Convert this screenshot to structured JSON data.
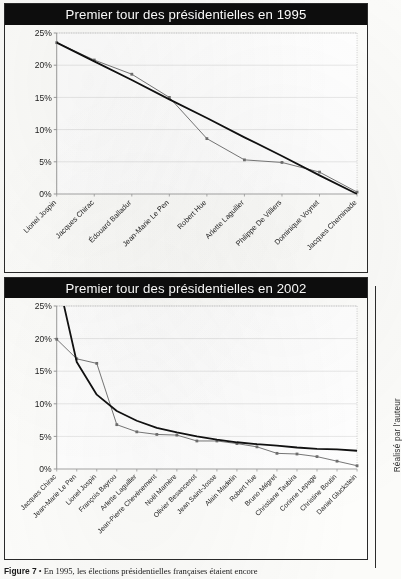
{
  "figure": {
    "caption_label": "Figure 7",
    "caption_sep": "•",
    "caption_text": "En 1995, les élections présidentielles françaises étaient encore",
    "credit": "Réalisé par l'auteur"
  },
  "colors": {
    "title_bar_bg": "#0d0d0d",
    "title_bar_text": "#ffffff",
    "data_series": "#6f6f6f",
    "trend_series": "#111111",
    "axis": "#8a8a8a",
    "gridline": "#d9d9d9",
    "plot_border": "#b8b8b8"
  },
  "charts": [
    {
      "id": "presidentielles-1995",
      "title": "Premier tour des présidentielles en 1995"
    },
    {
      "id": "presidentielles-2002",
      "title": "Premier tour des présidentielles en 2002"
    }
  ],
  "chart_data": [
    {
      "type": "line",
      "title": "Premier tour des présidentielles en 1995",
      "xlabel": "",
      "ylabel": "",
      "ylim": [
        0,
        25
      ],
      "ytick_labels": [
        "0%",
        "5%",
        "10%",
        "15%",
        "20%",
        "25%"
      ],
      "ytick_values": [
        0,
        5,
        10,
        15,
        20,
        25
      ],
      "grid": true,
      "legend": "none",
      "categories": [
        "Lionel Jospin",
        "Jacques Chirac",
        "Édouard Balladur",
        "Jean-Marie Le Pen",
        "Robert Hue",
        "Arlette Laguiller",
        "Philippe De Villiers",
        "Dominique Voynet",
        "Jacques Cheminade"
      ],
      "series": [
        {
          "name": "Résultats (%)",
          "color": "#6f6f6f",
          "markers": true,
          "values": [
            23.5,
            20.8,
            18.6,
            15.0,
            8.6,
            5.3,
            4.9,
            3.4,
            0.3
          ]
        },
        {
          "name": "Tendance linéaire",
          "color": "#111111",
          "markers": false,
          "values": [
            23.5,
            20.6,
            17.7,
            14.7,
            11.8,
            8.8,
            5.9,
            2.9,
            0.0
          ]
        }
      ]
    },
    {
      "type": "line",
      "title": "Premier tour des présidentielles en 2002",
      "xlabel": "",
      "ylabel": "",
      "ylim": [
        0,
        25
      ],
      "ytick_labels": [
        "0%",
        "5%",
        "10%",
        "15%",
        "20%",
        "25%"
      ],
      "ytick_values": [
        0,
        5,
        10,
        15,
        20,
        25
      ],
      "grid": true,
      "legend": "none",
      "categories": [
        "Jacques Chirac",
        "Jean-Marie Le Pen",
        "Lionel Jospin",
        "François Bayrou",
        "Arlette Laguiller",
        "Jean-Pierre Chevènement",
        "Noël Mamère",
        "Olivier Besancenot",
        "Jean Saint-Josse",
        "Alain Madelin",
        "Robert Hue",
        "Bruno Mégret",
        "Christiane Taubira",
        "Corinne Lepage",
        "Christine Boutin",
        "Daniel Gluckstein"
      ],
      "series": [
        {
          "name": "Résultats (%)",
          "color": "#6f6f6f",
          "markers": true,
          "values": [
            19.9,
            16.9,
            16.2,
            6.8,
            5.7,
            5.3,
            5.2,
            4.3,
            4.3,
            3.9,
            3.4,
            2.4,
            2.3,
            1.9,
            1.2,
            0.5
          ]
        },
        {
          "name": "Tendance puissance",
          "color": "#111111",
          "markers": false,
          "values": [
            30.0,
            16.4,
            11.4,
            8.9,
            7.4,
            6.3,
            5.6,
            5.0,
            4.5,
            4.1,
            3.8,
            3.6,
            3.3,
            3.1,
            3.0,
            2.8
          ]
        }
      ]
    }
  ]
}
